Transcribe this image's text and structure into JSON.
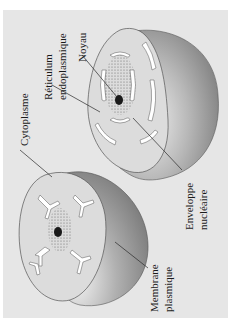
{
  "figure": {
    "background_color": "#e6e6e6",
    "cells": [
      {
        "name": "upper-cell",
        "description": "Cut-away cell showing nucleus surrounded by endoplasmic reticulum"
      },
      {
        "name": "lower-cell",
        "description": "Cut-away cell showing nucleus and branching endoplasmic reticulum"
      }
    ],
    "labels": {
      "cytoplasme": "Cytoplasme",
      "reticulum_line1": "Réticulum",
      "reticulum_line2": "endoplasmique",
      "noyau": "Noyau",
      "enveloppe_line1": "Enveloppe",
      "enveloppe_line2": "nucléaire",
      "membrane_line1": "Membrane",
      "membrane_line2": "plasmique"
    },
    "colors": {
      "cell_face": "#dcdcdc",
      "cell_shell_dark": "#8a8a8a",
      "cell_shell_light": "#c8c8c8",
      "er": "#ffffff",
      "nucleolus": "#1a1a1a",
      "leader_line": "#2a2a2a"
    }
  }
}
